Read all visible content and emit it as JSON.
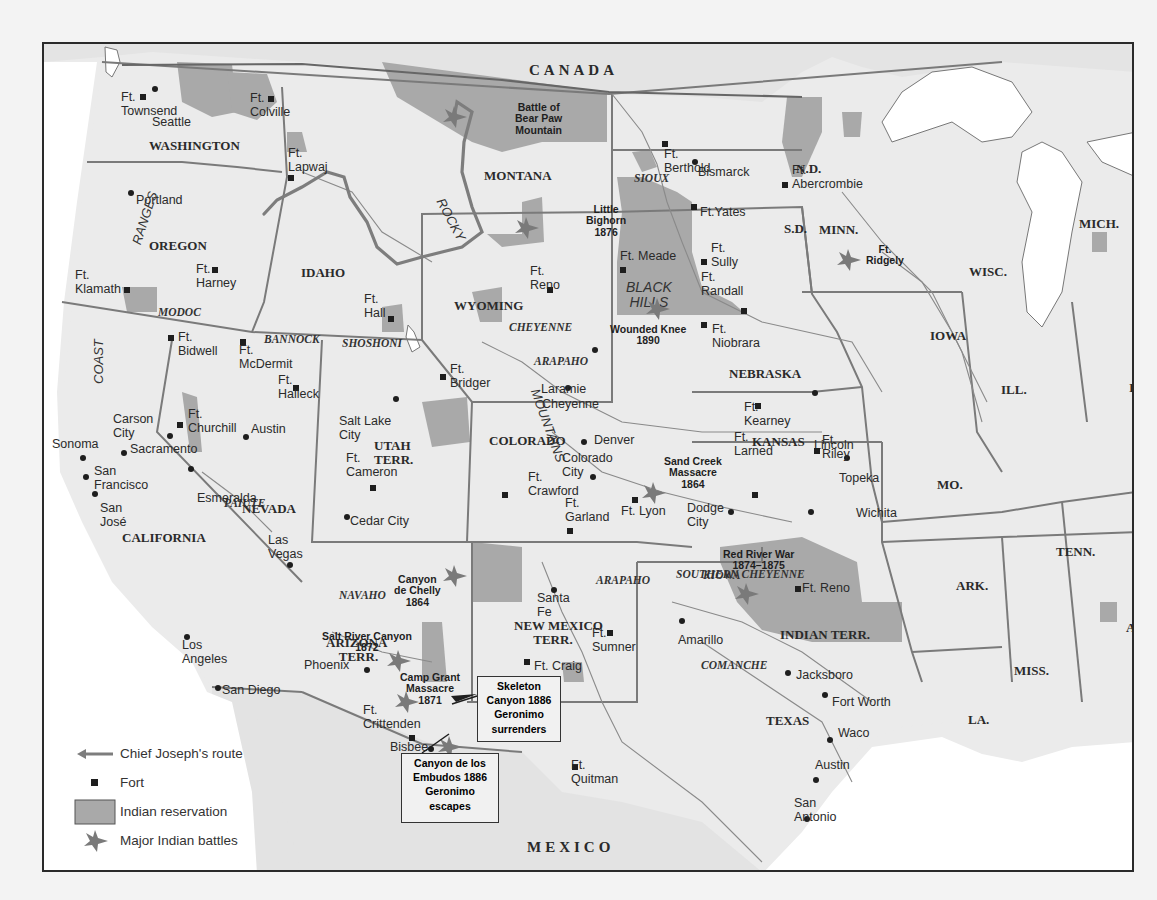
{
  "colors": {
    "land": "#ebebeb",
    "water": "#ffffff",
    "reservation": "#a9a9a9",
    "border": "#7a7a7a",
    "route": "#7d7d7d",
    "battle": "#7a7a7a",
    "frame": "#2a2a2a"
  },
  "countries": {
    "canada": "CANADA",
    "mexico": "MEXICO"
  },
  "states": [
    {
      "id": "washington",
      "label": "WASHINGTON",
      "x": 105,
      "y": 95
    },
    {
      "id": "oregon",
      "label": "OREGON",
      "x": 105,
      "y": 195
    },
    {
      "id": "idaho",
      "label": "IDAHO",
      "x": 257,
      "y": 222
    },
    {
      "id": "montana",
      "label": "MONTANA",
      "x": 440,
      "y": 125
    },
    {
      "id": "nd",
      "label": "N.D.",
      "x": 752,
      "y": 118
    },
    {
      "id": "sd",
      "label": "S.D.",
      "x": 740,
      "y": 178
    },
    {
      "id": "minn",
      "label": "MINN.",
      "x": 775,
      "y": 179
    },
    {
      "id": "wisc",
      "label": "WISC.",
      "x": 925,
      "y": 221
    },
    {
      "id": "mich",
      "label": "MICH.",
      "x": 1035,
      "y": 173
    },
    {
      "id": "iowa",
      "label": "IOWA",
      "x": 886,
      "y": 285
    },
    {
      "id": "wyoming",
      "label": "WYOMING",
      "x": 410,
      "y": 255
    },
    {
      "id": "nebraska",
      "label": "NEBRASKA",
      "x": 685,
      "y": 323
    },
    {
      "id": "ill",
      "label": "ILL.",
      "x": 957,
      "y": 339
    },
    {
      "id": "ind",
      "label": "IND.",
      "x": 1085,
      "y": 337
    },
    {
      "id": "nevada",
      "label": "NEVADA",
      "x": 198,
      "y": 458
    },
    {
      "id": "california",
      "label": "CALIFORNIA",
      "x": 78,
      "y": 487
    },
    {
      "id": "utah",
      "label": "UTAH\nTERR.",
      "x": 330,
      "y": 395
    },
    {
      "id": "colorado",
      "label": "COLORADO",
      "x": 445,
      "y": 390
    },
    {
      "id": "kansas",
      "label": "KANSAS",
      "x": 708,
      "y": 391
    },
    {
      "id": "mo",
      "label": "MO.",
      "x": 893,
      "y": 434
    },
    {
      "id": "ky",
      "label": "KY.",
      "x": 1088,
      "y": 445
    },
    {
      "id": "tenn",
      "label": "TENN.",
      "x": 1012,
      "y": 501
    },
    {
      "id": "ark",
      "label": "ARK.",
      "x": 912,
      "y": 535
    },
    {
      "id": "ala",
      "label": "ALA.",
      "x": 1082,
      "y": 577
    },
    {
      "id": "arizona",
      "label": "ARIZONA\n    TERR.",
      "x": 282,
      "y": 592
    },
    {
      "id": "newmexico",
      "label": "NEW MEXICO\n      TERR.",
      "x": 470,
      "y": 575
    },
    {
      "id": "indianterr",
      "label": "INDIAN TERR.",
      "x": 736,
      "y": 584
    },
    {
      "id": "miss",
      "label": "MISS.",
      "x": 970,
      "y": 620
    },
    {
      "id": "texas",
      "label": "TEXAS",
      "x": 722,
      "y": 670
    },
    {
      "id": "la",
      "label": "LA.",
      "x": 924,
      "y": 669
    }
  ],
  "tribes": [
    {
      "id": "sioux",
      "label": "SIOUX",
      "x": 590,
      "y": 128
    },
    {
      "id": "modoc",
      "label": "MODOC",
      "x": 114,
      "y": 262
    },
    {
      "id": "bannock",
      "label": "BANNOCK",
      "x": 220,
      "y": 289
    },
    {
      "id": "shoshoni",
      "label": "SHOSHONI",
      "x": 298,
      "y": 293
    },
    {
      "id": "cheyenne",
      "label": "CHEYENNE",
      "x": 465,
      "y": 277
    },
    {
      "id": "arapaho1",
      "label": "ARAPAHO",
      "x": 490,
      "y": 311
    },
    {
      "id": "paiute",
      "label": "PAIUTE",
      "x": 180,
      "y": 453
    },
    {
      "id": "arapaho2",
      "label": "ARAPAHO",
      "x": 552,
      "y": 530
    },
    {
      "id": "southerncheyenne",
      "label": "SOUTHERN CHEYENNE",
      "x": 632,
      "y": 524
    },
    {
      "id": "navaho",
      "label": "NAVAHO",
      "x": 295,
      "y": 545
    },
    {
      "id": "kiowa",
      "label": "KIOWA",
      "x": 659,
      "y": 525
    },
    {
      "id": "comanche",
      "label": "COMANCHE",
      "x": 657,
      "y": 615
    }
  ],
  "ranges": [
    {
      "id": "rocky",
      "label": "ROCKY",
      "x": 402,
      "y": 152,
      "rot": 62
    },
    {
      "id": "mountains",
      "label": "MOUNTAINS",
      "x": 497,
      "y": 343,
      "rot": 70
    },
    {
      "id": "ranges",
      "label": "RANGES",
      "x": 86,
      "y": 198,
      "rot": -72
    },
    {
      "id": "coast",
      "label": "COAST",
      "x": 48,
      "y": 340,
      "rot": -90
    },
    {
      "id": "blackhills",
      "label": "BLACK\nHILLS",
      "x": 582,
      "y": 236,
      "rot": 0
    }
  ],
  "cities": [
    {
      "label": "Seattle",
      "x": 108,
      "y": 72,
      "dx": 153,
      "dy": 87
    },
    {
      "label": "Portland",
      "x": 92,
      "y": 150,
      "dx": 129,
      "dy": 191
    },
    {
      "label": "Bismarck",
      "x": 654,
      "y": 122,
      "dx": 693,
      "dy": 160
    },
    {
      "label": "Carson\nCity",
      "x": 69,
      "y": 369,
      "dx": 168,
      "dy": 434
    },
    {
      "label": "Sacramento",
      "x": 86,
      "y": 399,
      "dx": 122,
      "dy": 451
    },
    {
      "label": "Sonoma",
      "x": 8,
      "y": 394,
      "dx": 81,
      "dy": 456
    },
    {
      "label": "San\nFrancisco",
      "x": 50,
      "y": 421,
      "dx": 84,
      "dy": 475
    },
    {
      "label": "San\nJosé",
      "x": 56,
      "y": 458,
      "dx": 93,
      "dy": 492
    },
    {
      "label": "Esmeralda",
      "x": 153,
      "y": 448,
      "dx": 189,
      "dy": 467
    },
    {
      "label": "Austin",
      "x": 207,
      "y": 379,
      "dx": 244,
      "dy": 435
    },
    {
      "label": "Salt Lake\nCity",
      "x": 295,
      "y": 371,
      "dx": 394,
      "dy": 397
    },
    {
      "label": "Cedar City",
      "x": 306,
      "y": 471,
      "dx": 345,
      "dy": 515
    },
    {
      "label": "Las\nVegas",
      "x": 224,
      "y": 490,
      "dx": 288,
      "dy": 563
    },
    {
      "label": "Los\nAngeles",
      "x": 138,
      "y": 595,
      "dx": 185,
      "dy": 635
    },
    {
      "label": "San Diego",
      "x": 178,
      "y": 640,
      "dx": 216,
      "dy": 686
    },
    {
      "label": "Phoenix",
      "x": 260,
      "y": 615,
      "dx": 365,
      "dy": 668
    },
    {
      "label": "Bisbee",
      "x": 346,
      "y": 697,
      "dx": 429,
      "dy": 747
    },
    {
      "label": "Cheyenne",
      "x": 498,
      "y": 354,
      "dx": 566,
      "dy": 386
    },
    {
      "label": "Laramie",
      "x": 497,
      "y": 339,
      "dx": 593,
      "dy": 348
    },
    {
      "label": "Denver",
      "x": 550,
      "y": 390,
      "dx": 582,
      "dy": 440
    },
    {
      "label": "Colorado\nCity",
      "x": 518,
      "y": 408,
      "dx": 591,
      "dy": 475
    },
    {
      "label": "Dodge\nCity",
      "x": 643,
      "y": 458,
      "dx": 729,
      "dy": 510
    },
    {
      "label": "Lincoln",
      "x": 770,
      "y": 395,
      "dx": 813,
      "dy": 391
    },
    {
      "label": "Topeka",
      "x": 795,
      "y": 428,
      "dx": 845,
      "dy": 456
    },
    {
      "label": "Wichita",
      "x": 812,
      "y": 463,
      "dx": 809,
      "dy": 510
    },
    {
      "label": "Santa\nFe",
      "x": 493,
      "y": 548,
      "dx": 552,
      "dy": 588
    },
    {
      "label": "Amarillo",
      "x": 634,
      "y": 590,
      "dx": 680,
      "dy": 619
    },
    {
      "label": "Jacksboro",
      "x": 752,
      "y": 625,
      "dx": 786,
      "dy": 671
    },
    {
      "label": "Fort Worth",
      "x": 788,
      "y": 652,
      "dx": 823,
      "dy": 693
    },
    {
      "label": "Waco",
      "x": 794,
      "y": 683,
      "dx": 828,
      "dy": 738
    },
    {
      "label": "Austin",
      "x": 771,
      "y": 715,
      "dx": 814,
      "dy": 778
    },
    {
      "label": "San\nAntonio",
      "x": 750,
      "y": 753,
      "dx": 805,
      "dy": 817
    }
  ],
  "forts": [
    {
      "label": "Ft.\nTownsend",
      "x": 77,
      "y": 47,
      "dx": 141,
      "dy": 95,
      "side": "right"
    },
    {
      "label": "Ft.\nColville",
      "x": 206,
      "y": 48,
      "dx": 269,
      "dy": 97,
      "side": "right"
    },
    {
      "label": "Ft.\nLapwaj",
      "x": 244,
      "y": 103,
      "dx": 289,
      "dy": 176,
      "side": "right"
    },
    {
      "label": "Ft.\nHarney",
      "x": 152,
      "y": 219,
      "dx": 213,
      "dy": 268,
      "side": "right"
    },
    {
      "label": "Ft.\nKlamath",
      "x": 31,
      "y": 225,
      "dx": 125,
      "dy": 288,
      "side": "right"
    },
    {
      "label": "Ft.\nHall",
      "x": 320,
      "y": 249,
      "dx": 389,
      "dy": 317,
      "side": "right"
    },
    {
      "label": "Ft.\nBidwell",
      "x": 134,
      "y": 287,
      "dx": 169,
      "dy": 336,
      "side": "right"
    },
    {
      "label": "Ft.\nMcDermit",
      "x": 195,
      "y": 300,
      "dx": 241,
      "dy": 340,
      "side": "right"
    },
    {
      "label": "Ft.\nHalleck",
      "x": 234,
      "y": 330,
      "dx": 294,
      "dy": 386,
      "side": "right"
    },
    {
      "label": "Ft.\nChurchill",
      "x": 144,
      "y": 364,
      "dx": 178,
      "dy": 423,
      "side": "right"
    },
    {
      "label": "Ft.\nCameron",
      "x": 302,
      "y": 408,
      "dx": 371,
      "dy": 486,
      "side": "right"
    },
    {
      "label": "Ft.\nBerthold",
      "x": 620,
      "y": 104,
      "dx": 663,
      "dy": 142,
      "side": "right"
    },
    {
      "label": "Ft.\nAbercrombie",
      "x": 748,
      "y": 120,
      "dx": 783,
      "dy": 183,
      "side": "right"
    },
    {
      "label": "Ft.Yates",
      "x": 656,
      "y": 162,
      "dx": 692,
      "dy": 205,
      "side": "right"
    },
    {
      "label": "Ft.\nSully",
      "x": 667,
      "y": 198,
      "dx": 702,
      "dy": 260,
      "side": "right"
    },
    {
      "label": "Ft. Meade",
      "x": 576,
      "y": 206,
      "dx": 621,
      "dy": 268,
      "side": "right"
    },
    {
      "label": "Ft.\nRandall",
      "x": 657,
      "y": 227,
      "dx": 742,
      "dy": 309,
      "side": "right"
    },
    {
      "label": "Ft.\nNiobrara",
      "x": 668,
      "y": 279,
      "dx": 702,
      "dy": 323,
      "side": "right"
    },
    {
      "label": "Ft.\nReno",
      "x": 486,
      "y": 221,
      "dx": 548,
      "dy": 288,
      "side": "right"
    },
    {
      "label": "Ft.\nBridger",
      "x": 406,
      "y": 319,
      "dx": 441,
      "dy": 375,
      "side": "right"
    },
    {
      "label": "Ft.\nKearney",
      "x": 700,
      "y": 357,
      "dx": 756,
      "dy": 404,
      "side": "right"
    },
    {
      "label": "Ft.\nRiley",
      "x": 778,
      "y": 390,
      "dx": 815,
      "dy": 449,
      "side": "right"
    },
    {
      "label": "Ft.\nLarned",
      "x": 690,
      "y": 387,
      "dx": 753,
      "dy": 493,
      "side": "right"
    },
    {
      "label": "Ft.\nCrawford",
      "x": 484,
      "y": 427,
      "dx": 503,
      "dy": 493,
      "side": "right"
    },
    {
      "label": "Ft.\nGarland",
      "x": 521,
      "y": 453,
      "dx": 568,
      "dy": 529,
      "side": "right"
    },
    {
      "label": "Ft. Lyon",
      "x": 577,
      "y": 461,
      "dx": 633,
      "dy": 498,
      "side": "left"
    },
    {
      "label": "Ft. Reno",
      "x": 758,
      "y": 538,
      "dx": 796,
      "dy": 587,
      "side": "right"
    },
    {
      "label": "Ft.\nSumner",
      "x": 548,
      "y": 583,
      "dx": 608,
      "dy": 631,
      "side": "right"
    },
    {
      "label": "Ft. Craig",
      "x": 490,
      "y": 616,
      "dx": 525,
      "dy": 660,
      "side": "right"
    },
    {
      "label": "Ft.\nCrittenden",
      "x": 319,
      "y": 660,
      "dx": 410,
      "dy": 736,
      "side": "right"
    },
    {
      "label": "Ft.\nQuitman",
      "x": 527,
      "y": 715,
      "dx": 573,
      "dy": 765,
      "side": "right"
    }
  ],
  "battles": [
    {
      "label": "Battle of\nBear Paw\nMountain",
      "x": 471,
      "y": 58,
      "sx": 452,
      "sy": 115
    },
    {
      "label": "Little\nBighorn\n1876",
      "x": 542,
      "y": 160,
      "sx": 524,
      "sy": 226
    },
    {
      "label": "Wounded Knee\n1890",
      "x": 566,
      "y": 280,
      "sx": 655,
      "sy": 307
    },
    {
      "label": "Ft.\nRidgely",
      "x": 822,
      "y": 200,
      "sx": 846,
      "sy": 258
    },
    {
      "label": "Sand Creek\nMassacre\n1864",
      "x": 620,
      "y": 412,
      "sx": 651,
      "sy": 491
    },
    {
      "label": "Red River War\n1874–1875",
      "x": 679,
      "y": 505,
      "sx": 744,
      "sy": 592
    },
    {
      "label": "Canyon\nde Chelly\n1864",
      "x": 350,
      "y": 530,
      "sx": 452,
      "sy": 574
    },
    {
      "label": "Salt River Canyon\n1872",
      "x": 278,
      "y": 587,
      "sx": 396,
      "sy": 659
    },
    {
      "label": "Camp Grant\nMassacre\n1871",
      "x": 356,
      "y": 628,
      "sx": 404,
      "sy": 700
    },
    {
      "label": "",
      "x": 0,
      "y": 0,
      "sx": 447,
      "sy": 745
    },
    {
      "label": "",
      "x": 0,
      "y": 0,
      "sx": 455,
      "sy": 771
    }
  ],
  "callouts": [
    {
      "id": "skeleton-canyon",
      "label": "Skeleton\nCanyon 1886\nGeronimo\nsurrenders",
      "x": 433,
      "y": 674,
      "w": 84,
      "h": 64
    },
    {
      "id": "canyon-embudos",
      "label": "Canyon de los\nEmbudos 1886\nGeronimo\nescapes",
      "x": 357,
      "y": 751,
      "w": 96,
      "h": 66
    }
  ],
  "legend": {
    "items": [
      {
        "id": "route",
        "label": "Chief Joseph's route"
      },
      {
        "id": "fort",
        "label": "Fort"
      },
      {
        "id": "reservation",
        "label": "Indian reservation"
      },
      {
        "id": "battle",
        "label": "Major Indian battles"
      }
    ]
  }
}
